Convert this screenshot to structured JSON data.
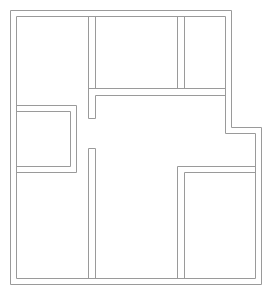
{
  "document": {
    "title": "Floor Plan",
    "type": "architectural-floor-plan",
    "width": 274,
    "height": 298,
    "background_color": "#ffffff",
    "line_color": "#9a9a9a",
    "line_width": 1,
    "wall_thickness": 6,
    "scale_note": "",
    "labels_visible": false
  },
  "plan_data": {
    "type": "floor-plan",
    "units": "px",
    "outer_boundary": {
      "name": "building-outline",
      "description": "L-shaped / stepped outer wall, outer face polygon",
      "outer_points": [
        [
          10,
          10
        ],
        [
          232,
          10
        ],
        [
          232,
          127
        ],
        [
          262,
          127
        ],
        [
          262,
          285
        ],
        [
          10,
          285
        ]
      ],
      "inner_points": [
        [
          16,
          16
        ],
        [
          226,
          16
        ],
        [
          226,
          133
        ],
        [
          256,
          133
        ],
        [
          256,
          279
        ],
        [
          16,
          279
        ]
      ]
    },
    "rooms": [
      {
        "id": "room-top-left",
        "name": "top-left-room",
        "x": 16,
        "y": 16,
        "width": 72,
        "height": 89,
        "area_px": 6408
      },
      {
        "id": "room-top-middle",
        "name": "top-middle-room",
        "x": 95,
        "y": 16,
        "width": 82,
        "height": 72,
        "area_px": 5904
      },
      {
        "id": "room-top-right",
        "name": "top-right-room",
        "x": 184,
        "y": 16,
        "width": 42,
        "height": 72,
        "area_px": 3024
      },
      {
        "id": "room-small-left",
        "name": "small-left-room",
        "x": 16,
        "y": 111,
        "width": 54,
        "height": 55,
        "area_px": 2970
      },
      {
        "id": "room-bottom-left",
        "name": "bottom-left-room",
        "x": 16,
        "y": 173,
        "width": 72,
        "height": 106,
        "area_px": 7632
      },
      {
        "id": "room-bottom-middle",
        "name": "bottom-middle-corridor-room",
        "x": 95,
        "y": 149,
        "width": 82,
        "height": 130,
        "area_px": 10660
      },
      {
        "id": "room-bottom-right",
        "name": "bottom-right-room",
        "x": 184,
        "y": 173,
        "width": 72,
        "height": 106,
        "area_px": 7632
      }
    ],
    "interior_walls": [
      {
        "id": "wall-vert-left-upper",
        "name": "vertical-wall-left-upper",
        "orientation": "vertical",
        "x": 88,
        "y1": 16,
        "y2": 105,
        "thickness": 7
      },
      {
        "id": "wall-horiz-top-middle",
        "name": "horizontal-wall-below-top-rooms",
        "orientation": "horizontal",
        "y": 88,
        "x1": 88,
        "x2": 226,
        "thickness": 7
      },
      {
        "id": "wall-stub-upper",
        "name": "wall-stub-upper-center",
        "orientation": "vertical",
        "x": 88,
        "y1": 88,
        "y2": 118,
        "thickness": 7
      },
      {
        "id": "wall-vert-center-lower",
        "name": "vertical-wall-center-lower",
        "orientation": "vertical",
        "x": 88,
        "y1": 148,
        "y2": 279,
        "thickness": 7
      },
      {
        "id": "wall-small-room-right",
        "name": "small-room-right-wall",
        "orientation": "vertical",
        "x": 70,
        "y1": 105,
        "y2": 173,
        "thickness": 6
      },
      {
        "id": "wall-small-room-top",
        "name": "small-room-top-wall",
        "orientation": "horizontal",
        "y": 105,
        "x1": 16,
        "x2": 76,
        "thickness": 6
      },
      {
        "id": "wall-small-room-bottom",
        "name": "small-room-bottom-wall",
        "orientation": "horizontal",
        "y": 166,
        "x1": 16,
        "x2": 76,
        "thickness": 7
      },
      {
        "id": "wall-vert-right-lower",
        "name": "vertical-wall-right-lower",
        "orientation": "vertical",
        "x": 177,
        "y1": 166,
        "y2": 279,
        "thickness": 7
      },
      {
        "id": "wall-horiz-bottom-right",
        "name": "horizontal-wall-above-bottom-right-room",
        "orientation": "horizontal",
        "y": 166,
        "x1": 177,
        "x2": 256,
        "thickness": 7
      }
    ],
    "openings": [
      {
        "id": "opening-center-hall",
        "name": "doorway-center-hall",
        "orientation": "vertical",
        "x": 88,
        "y1": 118,
        "y2": 148,
        "width_px": 30
      }
    ]
  }
}
